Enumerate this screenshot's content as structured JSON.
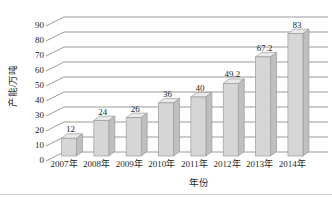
{
  "chart_data": {
    "type": "bar",
    "variant": "3d-column",
    "title": "",
    "xlabel": "年份",
    "ylabel": "产能/万吨",
    "categories": [
      "2007年",
      "2008年",
      "2009年",
      "2010年",
      "2011年",
      "2012年",
      "2013年",
      "2014年"
    ],
    "values": [
      12,
      24,
      26,
      36,
      40,
      49.2,
      67.2,
      83
    ],
    "value_labels": [
      "12",
      "24",
      "26",
      "36",
      "40",
      "49.2",
      "67.2",
      "83"
    ],
    "ylim": [
      0,
      90
    ],
    "ytick_step": 10,
    "yticks": [
      "0",
      "10",
      "20",
      "30",
      "40",
      "50",
      "60",
      "70",
      "80",
      "90"
    ],
    "grid": true,
    "legend": false
  },
  "colors": {
    "bar_front": "#d6d6d6",
    "bar_side": "#bfbfbf",
    "bar_top": "#e9e9e9",
    "bar_outline": "#9b9b9b",
    "gridline": "#8f8f8f",
    "text": "#1f1f1f",
    "background": "#ffffff",
    "divider": "#c8c8c8"
  }
}
